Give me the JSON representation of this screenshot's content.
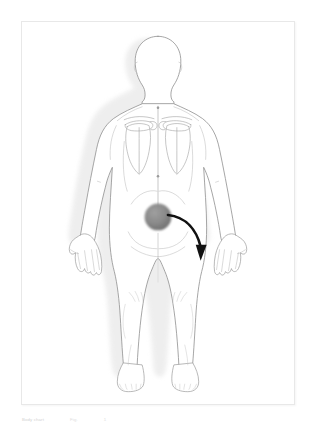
{
  "document": {
    "title": "Body Chart — Posterior View",
    "caption": "Body chart",
    "caption_meta_1": "Fig.",
    "caption_meta_2": "1",
    "background_color": "#ffffff",
    "frame_border_color": "#e8e8e8"
  },
  "figure": {
    "name": "human-body-posterior-diagram",
    "view": "posterior",
    "outline_color": "#8c8c8c",
    "detail_color": "#bdbdbd",
    "shadow_color": "#e4e4e4",
    "fill_color": "#ffffff"
  },
  "annotations": {
    "pain_marker": {
      "label": "pain-location-marker",
      "region": "Sacrum / lower back",
      "shape": "circle",
      "center_x": 158,
      "center_y": 196,
      "radius": 12,
      "color_center": "#8f8f8f",
      "color_edge": "#6e6e6e"
    },
    "radiation_arrow": {
      "label": "pain-radiation-arrow",
      "direction": "down-right",
      "from": "Sacrum",
      "to": "Right buttock / posterior thigh",
      "color": "#111111",
      "stroke_width": 2.6
    },
    "midline": {
      "label": "spine-midline",
      "color": "#b5b5b5"
    },
    "landmark_dots": [
      {
        "name": "landmark-c7",
        "x": 163,
        "y": 85
      },
      {
        "name": "landmark-thoracolumbar",
        "x": 160,
        "y": 155
      }
    ]
  }
}
